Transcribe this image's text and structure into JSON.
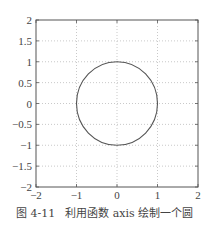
{
  "chart_data": {
    "type": "line",
    "title": "",
    "xlabel": "",
    "ylabel": "",
    "xlim": [
      -2,
      2
    ],
    "ylim": [
      -2,
      2
    ],
    "grid": true,
    "grid_style": "dotted",
    "axis_equal": true,
    "x_ticks": [
      -2,
      -1,
      0,
      1,
      2
    ],
    "x_tick_labels": [
      "-2",
      "-1",
      "0",
      "1",
      "2"
    ],
    "y_ticks": [
      2,
      1.5,
      1,
      0.5,
      0,
      -0.5,
      -1,
      -1.5,
      -2
    ],
    "y_tick_labels": [
      "2",
      "1.5",
      "1",
      "0.5",
      "0",
      "-0.5",
      "-1",
      "-1.5",
      "-2"
    ],
    "series": [
      {
        "name": "unit circle",
        "shape": "circle",
        "center": [
          0,
          0
        ],
        "radius": 1,
        "color": "#555555",
        "x": [
          1,
          0.924,
          0.707,
          0.383,
          0,
          -0.383,
          -0.707,
          -0.924,
          -1,
          -0.924,
          -0.707,
          -0.383,
          0,
          0.383,
          0.707,
          0.924,
          1
        ],
        "y": [
          0,
          0.383,
          0.707,
          0.924,
          1,
          0.924,
          0.707,
          0.383,
          0,
          -0.383,
          -0.707,
          -0.924,
          -1,
          -0.924,
          -0.707,
          -0.383,
          0
        ]
      }
    ],
    "legend": null
  },
  "caption": {
    "figure_number": "图 4-11",
    "text": "利用函数 axis 绘制一个圆"
  },
  "colors": {
    "axis": "#555555",
    "grid": "#bbbbbb",
    "curve": "#555555"
  }
}
